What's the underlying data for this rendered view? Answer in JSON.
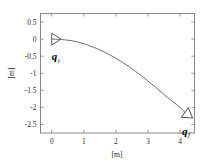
{
  "figure": {
    "background_color": "#ffffff",
    "axis_color": "#7d7d7d",
    "curve_color": "#6e6e6e",
    "marker_color": "#5a5a5a"
  },
  "chart_data": {
    "type": "line",
    "title": "",
    "subtitle": "",
    "xlabel": "[m]",
    "ylabel": "[m]",
    "xlim": [
      -0.35,
      4.45
    ],
    "ylim": [
      -2.75,
      0.75
    ],
    "xticks": [
      0,
      1,
      2,
      3,
      4
    ],
    "xticklabels": [
      "0",
      "1",
      "2",
      "3",
      "4"
    ],
    "yticks": [
      0.5,
      0,
      -0.5,
      -1,
      -1.5,
      -2,
      -2.5
    ],
    "yticklabels": [
      "0.5",
      "0",
      "-0.5",
      "-1",
      "-1.5",
      "-2",
      "-2.5"
    ],
    "grid": false,
    "legend": null,
    "legend_position": "none",
    "series": [
      {
        "name": "trajectory",
        "x": [
          0.0,
          0.4,
          0.8,
          1.2,
          1.6,
          2.0,
          2.4,
          2.8,
          3.2,
          3.6,
          4.0,
          4.15
        ],
        "y": [
          0.0,
          -0.02,
          -0.08,
          -0.2,
          -0.36,
          -0.56,
          -0.8,
          -1.08,
          -1.38,
          -1.7,
          -2.0,
          -2.15
        ]
      }
    ],
    "annotations": [
      {
        "name": "initial-pose",
        "label": "q",
        "subscript": "i",
        "x": 0.0,
        "y": 0.0,
        "heading_deg": 0,
        "marker": "triangle"
      },
      {
        "name": "final-pose",
        "label": "q",
        "subscript": "f",
        "x": 4.15,
        "y": -2.15,
        "heading_deg": -35,
        "marker": "triangle"
      }
    ]
  },
  "axes": {
    "x_axis_label": "[m]",
    "y_axis_label": "[m]"
  },
  "markers": {
    "initial": {
      "label": "q",
      "subscript": "i"
    },
    "final": {
      "label": "q",
      "subscript": "f"
    }
  }
}
